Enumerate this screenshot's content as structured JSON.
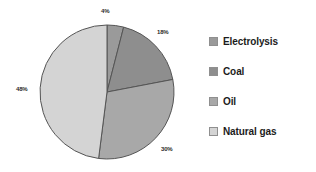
{
  "chart_data": {
    "type": "pie",
    "title": "",
    "categories": [
      "Electrolysis",
      "Coal",
      "Oil",
      "Natural gas"
    ],
    "values": [
      4,
      18,
      30,
      48
    ],
    "value_labels": [
      "4%",
      "18%",
      "30%",
      "48%"
    ],
    "unit": "%",
    "colors": [
      "#9a9a9a",
      "#8e8e8e",
      "#a8a8a8",
      "#d4d4d4"
    ],
    "slice_border_color": "#555555",
    "legend_position": "right",
    "grid": false,
    "start_angle_deg": 0,
    "direction": "clockwise"
  },
  "labels": {
    "electrolysis_pct": "4%",
    "coal_pct": "18%",
    "oil_pct": "30%",
    "natural_gas_pct": "48%"
  },
  "legend": {
    "items": [
      {
        "label": "Electrolysis",
        "color": "#9a9a9a"
      },
      {
        "label": "Coal",
        "color": "#8e8e8e"
      },
      {
        "label": "Oil",
        "color": "#a8a8a8"
      },
      {
        "label": "Natural gas",
        "color": "#d4d4d4"
      }
    ]
  }
}
